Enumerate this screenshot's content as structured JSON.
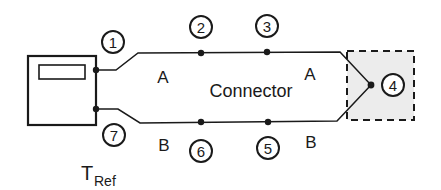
{
  "diagram": {
    "title": "",
    "instrument": {
      "label": "meter"
    },
    "labels": {
      "connector": "Connector",
      "wire_a_left": "A",
      "wire_a_right": "A",
      "wire_b_left": "B",
      "wire_b_right": "B",
      "t_ref_main": "T",
      "t_ref_sub": "Ref"
    },
    "nodes": [
      {
        "id": "1",
        "label": "1"
      },
      {
        "id": "2",
        "label": "2"
      },
      {
        "id": "3",
        "label": "3"
      },
      {
        "id": "4",
        "label": "4"
      },
      {
        "id": "5",
        "label": "5"
      },
      {
        "id": "6",
        "label": "6"
      },
      {
        "id": "7",
        "label": "7"
      }
    ],
    "colors": {
      "line": "#1a1a1a",
      "junction_fill": "#e6e6e6"
    }
  }
}
